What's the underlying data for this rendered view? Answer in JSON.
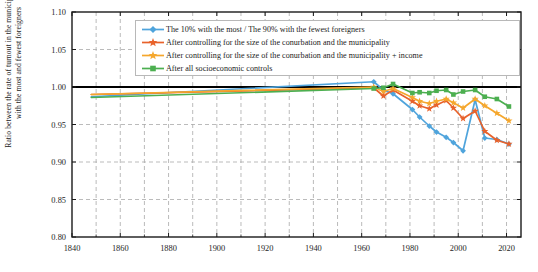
{
  "chart_data": {
    "type": "line",
    "title": "",
    "xlabel": "",
    "ylabel": "Ratio between the rate of turnout in the municipalities with the most and fewest foreigners",
    "ylabel_line1": "Ratio between the rate of turnout in the municipalities",
    "ylabel_line2": "with the most and fewest foreigners",
    "xlim": [
      1840,
      2026
    ],
    "ylim": [
      0.8,
      1.1
    ],
    "xticks": [
      1840,
      1860,
      1880,
      1900,
      1920,
      1940,
      1960,
      1980,
      2000,
      2020
    ],
    "xtick_labels": [
      "1840",
      "1860",
      "1880",
      "1900",
      "1920",
      "1940",
      "1960",
      "1980",
      "2000",
      "2020"
    ],
    "xticks_minor": [
      1850,
      1870,
      1890,
      1910,
      1930,
      1950,
      1970,
      1990,
      2010
    ],
    "yticks": [
      0.8,
      0.85,
      0.9,
      0.95,
      1.0,
      1.05,
      1.1
    ],
    "ytick_labels": [
      "0.80",
      "0.85",
      "0.90",
      "0.95",
      "1.00",
      "1.05",
      "1.10"
    ],
    "grid": true,
    "grid_style": "dashed",
    "grid_color": "#aaaaaa",
    "reference_line": {
      "y": 1.0,
      "color": "#000000",
      "width": 1.8
    },
    "legend_position": "upper center",
    "series": [
      {
        "name": "The 10% with the most / The 90% with the fewest foreigners",
        "color": "#4FA4DC",
        "marker": "diamond",
        "x": [
          1848,
          1965,
          1969,
          1973,
          1981,
          1984,
          1988,
          1991,
          1995,
          1998,
          2002,
          2007,
          2011,
          2016,
          2021
        ],
        "y": [
          0.987,
          1.007,
          0.996,
          0.991,
          0.97,
          0.96,
          0.948,
          0.94,
          0.933,
          0.926,
          0.915,
          0.983,
          0.932,
          0.93,
          0.924
        ]
      },
      {
        "name": "After controlling for the size of the conurbation and the municipality",
        "color": "#E8622B",
        "marker": "star",
        "x": [
          1848,
          1965,
          1969,
          1973,
          1981,
          1984,
          1988,
          1991,
          1995,
          1998,
          2002,
          2007,
          2011,
          2016,
          2021
        ],
        "y": [
          0.99,
          0.999,
          0.988,
          0.996,
          0.981,
          0.975,
          0.971,
          0.976,
          0.982,
          0.972,
          0.958,
          0.968,
          0.941,
          0.929,
          0.924
        ]
      },
      {
        "name": "After controlling for the size of the conurbation and the municipality + income",
        "color": "#F5A72D",
        "marker": "star",
        "x": [
          1848,
          1965,
          1969,
          1973,
          1981,
          1984,
          1988,
          1991,
          1995,
          1998,
          2002,
          2007,
          2011,
          2016,
          2021
        ],
        "y": [
          0.99,
          1.0,
          0.994,
          0.998,
          0.986,
          0.981,
          0.978,
          0.981,
          0.984,
          0.979,
          0.972,
          0.984,
          0.975,
          0.965,
          0.955
        ]
      },
      {
        "name": "After all socioeconomic controls",
        "color": "#4CAF50",
        "marker": "square",
        "x": [
          1848,
          1965,
          1969,
          1973,
          1981,
          1984,
          1988,
          1991,
          1995,
          1998,
          2002,
          2007,
          2011,
          2016,
          2021
        ],
        "y": [
          0.986,
          0.998,
          0.999,
          1.004,
          0.992,
          0.993,
          0.992,
          0.995,
          0.996,
          0.99,
          0.994,
          0.996,
          0.987,
          0.984,
          0.974
        ]
      }
    ]
  },
  "legend": {
    "entries": [
      {
        "label": "The 10% with the most / The 90% with the fewest foreigners",
        "color": "#4FA4DC",
        "marker": "diamond"
      },
      {
        "label": "After controlling for the size of the conurbation and the municipality",
        "color": "#E8622B",
        "marker": "star"
      },
      {
        "label": "After controlling for the size of the conurbation and the municipality + income",
        "color": "#F5A72D",
        "marker": "star"
      },
      {
        "label": "After all socioeconomic controls",
        "color": "#4CAF50",
        "marker": "square"
      }
    ]
  }
}
